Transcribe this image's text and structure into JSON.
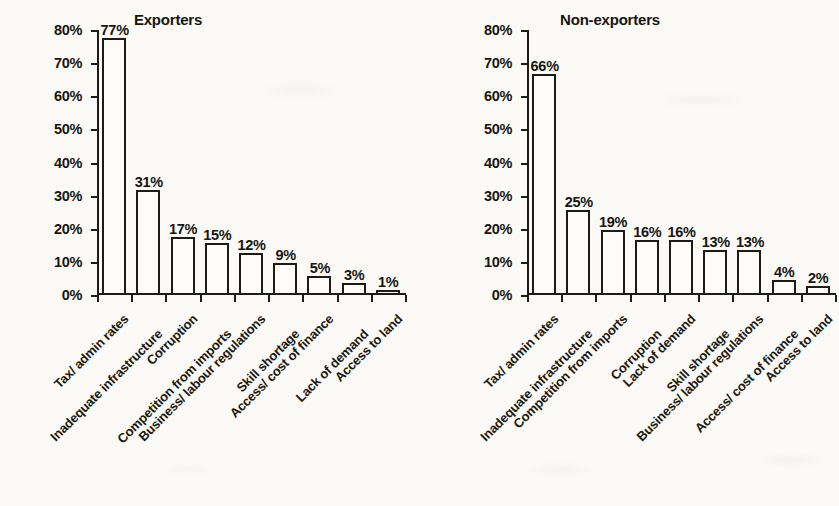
{
  "chart_data": [
    {
      "type": "bar",
      "title": "Exporters",
      "xlabel": "",
      "ylabel": "",
      "ylim": [
        0,
        80
      ],
      "ytick_labels": [
        "0%",
        "10%",
        "20%",
        "30%",
        "40%",
        "50%",
        "60%",
        "70%",
        "80%"
      ],
      "ytick_values": [
        0,
        10,
        20,
        30,
        40,
        50,
        60,
        70,
        80
      ],
      "grid": false,
      "legend": "none",
      "categories": [
        "Tax/ admin rates",
        "Inadequate infrastructure",
        "Corruption",
        "Competition from imports",
        "Business/ labour regulations",
        "Skill shortage",
        "Access/ cost of finance",
        "Lack of demand",
        "Access to land"
      ],
      "values": [
        77,
        31,
        17,
        15,
        12,
        9,
        5,
        3,
        1
      ],
      "data_labels": [
        "77%",
        "31%",
        "17%",
        "15%",
        "12%",
        "9%",
        "5%",
        "3%",
        "1%"
      ]
    },
    {
      "type": "bar",
      "title": "Non-exporters",
      "xlabel": "",
      "ylabel": "",
      "ylim": [
        0,
        80
      ],
      "ytick_labels": [
        "0%",
        "10%",
        "20%",
        "30%",
        "40%",
        "50%",
        "60%",
        "70%",
        "80%"
      ],
      "ytick_values": [
        0,
        10,
        20,
        30,
        40,
        50,
        60,
        70,
        80
      ],
      "grid": false,
      "legend": "none",
      "categories": [
        "Tax/ admin rates",
        "Inadequate infrastructure",
        "Competition from imports",
        "Corruption",
        "Lack of demand",
        "Skill shortage",
        "Business/ labour regulations",
        "Access/ cost of finance",
        "Access to land"
      ],
      "values": [
        66,
        25,
        19,
        16,
        16,
        13,
        13,
        4,
        2
      ],
      "data_labels": [
        "66%",
        "25%",
        "19%",
        "16%",
        "16%",
        "13%",
        "13%",
        "4%",
        "2%"
      ]
    }
  ],
  "colors": {
    "ink": "#1c1b16",
    "paper": "#fbfaf7",
    "bar_fill": "#fdfcf9"
  }
}
